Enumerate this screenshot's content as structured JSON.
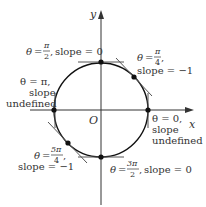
{
  "axes": {
    "x_label": "x",
    "y_label": "y",
    "origin_label": "O"
  },
  "circle": {
    "center": [
      101,
      110
    ],
    "radius": 47
  },
  "points": [
    {
      "name": "theta-0",
      "theta": "0",
      "slope": "undefined",
      "label_lines": [
        "θ = 0,",
        "slope",
        "undefined"
      ]
    },
    {
      "name": "theta-pi-over-4",
      "theta": "π/4",
      "slope": "−1",
      "label_lines": [
        "θ = π/4,",
        "slope = −1"
      ]
    },
    {
      "name": "theta-pi-over-2",
      "theta": "π/2",
      "slope": "0",
      "label_lines": [
        "θ = π/2, slope = 0"
      ]
    },
    {
      "name": "theta-pi",
      "theta": "π",
      "slope": "undefined",
      "label_lines": [
        "θ = π,",
        "slope",
        "undefined"
      ]
    },
    {
      "name": "theta-5pi-over-4",
      "theta": "5π/4",
      "slope": "−1",
      "label_lines": [
        "θ = 5π/4,",
        "slope = −1"
      ]
    },
    {
      "name": "theta-3pi-over-2",
      "theta": "3π/2",
      "slope": "0",
      "label_lines": [
        "θ = 3π/2, slope = 0"
      ]
    }
  ],
  "text": {
    "theta": "θ",
    "eq": "=",
    "comma": ",",
    "slope_eq_0": "slope = 0",
    "slope_eq_neg1": "slope = −1",
    "slope": "slope",
    "undefined": "undefined",
    "pi": "π",
    "two": "2",
    "four": "4",
    "zero": "0",
    "five_pi": "5π",
    "three_pi": "3π"
  },
  "colors": {
    "curve": "#111111",
    "axis": "#333333",
    "tangent": "#555555",
    "text": "#333333"
  }
}
